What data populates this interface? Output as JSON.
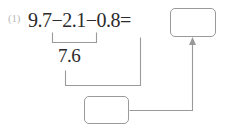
{
  "worksheet": {
    "problem_number": "(1)",
    "expression": "9.7−2.1−0.8=",
    "expression_parts": {
      "operand_1": "9.7",
      "operator_1": "−",
      "operand_2": "2.1",
      "operator_2": "−",
      "operand_3": "0.8",
      "equals": "="
    },
    "partial_result": "7.6",
    "answer_boxes": [
      {
        "id": "answer-box-step",
        "value": "",
        "placeholder": "",
        "role": "intermediate-answer"
      },
      {
        "id": "answer-box-final",
        "value": "",
        "placeholder": "",
        "role": "final-answer"
      }
    ],
    "annotations": {
      "bracket_upper_label": "7.6",
      "arrow_icon": "arrow-up-icon"
    },
    "colors": {
      "text": "#2b2b2b",
      "problem_number": "#b9b9b9",
      "line": "#9a9a9a",
      "box_border": "#9a9a9a",
      "background": "#ffffff"
    }
  }
}
